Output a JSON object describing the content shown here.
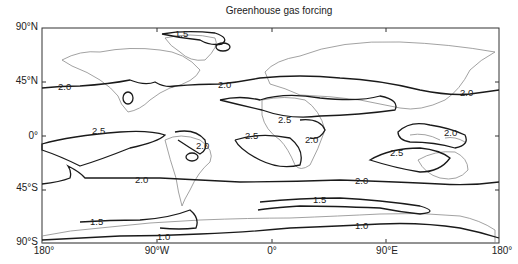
{
  "title": "Greenhouse gas forcing",
  "y_axis": {
    "ticks": [
      "90°N",
      "45°N",
      "0°",
      "45°S",
      "90°S"
    ]
  },
  "x_axis": {
    "ticks": [
      "180°",
      "90°W",
      "0°",
      "90°E",
      "180°"
    ]
  },
  "contour_labels": [
    "1.5",
    "2.0",
    "2.0",
    "2.0",
    "2.5",
    "2.5",
    "2.5",
    "2.0",
    "2.0",
    "2.5",
    "2.0",
    "2.0",
    "2.0",
    "1.5",
    "1.5",
    "1.0",
    "1.0"
  ],
  "colors": {
    "contour": "#1a1a1a",
    "coastline": "#8a8a8a",
    "frame": "#333333"
  }
}
